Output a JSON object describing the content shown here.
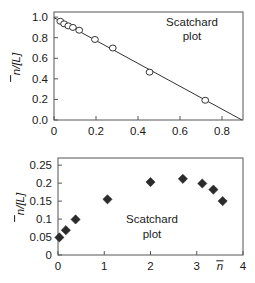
{
  "figure": {
    "title": "",
    "background_color": "#ffffff",
    "axis_color": "#555555",
    "marker_color_top": "#333333",
    "marker_color_bottom": "#2b2b2b"
  },
  "chart_data": [
    {
      "type": "scatter",
      "id": "scatchard-top",
      "title": "",
      "annotation_line1": "Scatchard",
      "annotation_line2": "plot",
      "xlabel": "",
      "ylabel": "n̄/[L]",
      "ylabel_plain": "n/[L]",
      "xlim": [
        0,
        0.9
      ],
      "ylim": [
        0.0,
        1.05
      ],
      "xticks": [
        0,
        0.2,
        0.4,
        0.6,
        0.8
      ],
      "xticklabels": [
        "0",
        "0.2",
        "0.4",
        "0.6",
        "0.8"
      ],
      "yticks": [
        0.0,
        0.2,
        0.4,
        0.6,
        0.8,
        1.0
      ],
      "yticklabels": [
        "0.0",
        "0.2",
        "0.4",
        "0.6",
        "0.8",
        "1.0"
      ],
      "grid": false,
      "legend": "none",
      "marker": "open-circle",
      "x": [
        0.03,
        0.048,
        0.068,
        0.09,
        0.12,
        0.195,
        0.28,
        0.455,
        0.72
      ],
      "y": [
        0.96,
        0.935,
        0.915,
        0.9,
        0.873,
        0.783,
        0.7,
        0.465,
        0.192
      ],
      "fit_line": {
        "label": "linear fit",
        "x": [
          0.0,
          0.895
        ],
        "y": [
          0.995,
          0.0
        ]
      }
    },
    {
      "type": "scatter",
      "id": "scatchard-bottom",
      "title": "",
      "annotation_line1": "Scatchard",
      "annotation_line2": "plot",
      "xlabel": "n̄",
      "xlabel_plain": "n",
      "ylabel": "n̄/[L]",
      "ylabel_plain": "n/[L]",
      "xlim": [
        0,
        4
      ],
      "ylim": [
        0,
        0.27
      ],
      "xticks": [
        0,
        1,
        2,
        3,
        4
      ],
      "xticklabels": [
        "0",
        "1",
        "2",
        "3",
        "4"
      ],
      "yticks": [
        0,
        0.05,
        0.1,
        0.15,
        0.2,
        0.25
      ],
      "yticklabels": [
        "0",
        "0.05",
        "0.1",
        "0.15",
        "0.2",
        "0.25"
      ],
      "grid": false,
      "legend": "none",
      "marker": "filled-diamond",
      "x": [
        0.03,
        0.17,
        0.38,
        1.07,
        2.0,
        2.7,
        3.12,
        3.36,
        3.56
      ],
      "y": [
        0.049,
        0.069,
        0.099,
        0.155,
        0.203,
        0.212,
        0.199,
        0.182,
        0.15
      ]
    }
  ]
}
